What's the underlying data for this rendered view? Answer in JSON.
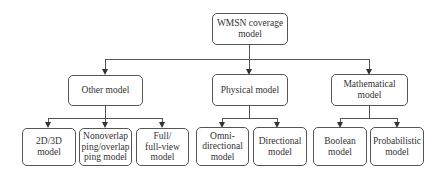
{
  "diagram": {
    "root": {
      "label": "WMSN coverage model"
    },
    "categories": [
      {
        "label": "Other model",
        "children": [
          {
            "label": "2D/3D model"
          },
          {
            "label": "Nonoverlapping/overlapping model"
          },
          {
            "label": "Full/full-view model"
          }
        ]
      },
      {
        "label": "Physical model",
        "children": [
          {
            "label": "Omni-directional model"
          },
          {
            "label": "Directional model"
          }
        ]
      },
      {
        "label": "Mathematical model",
        "children": [
          {
            "label": "Boolean model"
          },
          {
            "label": "Probabilistic model"
          }
        ]
      }
    ]
  },
  "display": {
    "root": "WMSN coverage\nmodel",
    "other": "Other model",
    "physical": "Physical model",
    "mathematical": "Mathematical\nmodel",
    "leaf_2d3d": "2D/3D\nmodel",
    "leaf_nonoverlap": "Nonoverlap\nping/overlap\nping model",
    "leaf_full": "Full/\nfull-view\nmodel",
    "leaf_omni": "Omni-\ndirectional\nmodel",
    "leaf_directional": "Directional\nmodel",
    "leaf_boolean": "Boolean\nmodel",
    "leaf_probabilistic": "Probabilistic\nmodel"
  }
}
